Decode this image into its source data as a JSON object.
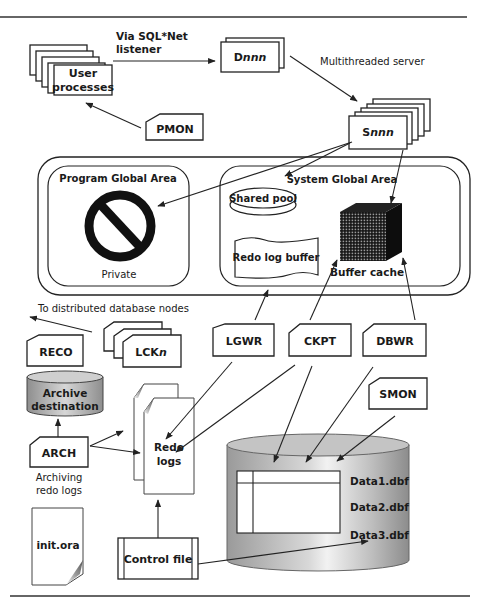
{
  "diagram": {
    "top_rule": true,
    "bottom_rule": true
  },
  "labels": {
    "via_sqlnet_line1": "Via SQL*Net",
    "via_sqlnet_line2": "listener",
    "multithreaded_server": "Multithreaded server",
    "to_distributed": "To distributed database nodes",
    "archiving_line1": "Archiving",
    "archiving_line2": "redo logs"
  },
  "nodes": {
    "user_processes_line1": "User",
    "user_processes_line2": "processes",
    "dispatcher_prefix": "D",
    "dispatcher_suffix": "nnn",
    "shared_server_prefix": "S",
    "shared_server_suffix": "nnn",
    "pmon": "PMON",
    "pga_title": "Program Global Area",
    "pga_private": "Private",
    "sga_title": "System Global Area",
    "shared_pool": "Shared pool",
    "redo_log_buffer": "Redo log buffer",
    "buffer_cache": "Buffer cache",
    "reco": "RECO",
    "lck_prefix": "LCK",
    "lck_suffix": "n",
    "lgwr": "LGWR",
    "ckpt": "CKPT",
    "dbwr": "DBWR",
    "smon": "SMON",
    "archive_dest_line1": "Archive",
    "archive_dest_line2": "destination",
    "arch": "ARCH",
    "redo_logs_line1": "Redo",
    "redo_logs_line2": "logs",
    "init_ora": "init.ora",
    "control_file": "Control file",
    "datafiles": [
      "Data1.dbf",
      "Data2.dbf",
      "Data3.dbf"
    ]
  },
  "colors": {
    "stroke": "#222222",
    "background": "#ffffff",
    "cylinder_gray": "#b8b8b8",
    "cube_dark": "#111111"
  }
}
